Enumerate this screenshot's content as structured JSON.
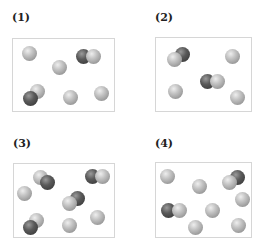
{
  "panels": [
    {
      "label": "(1)",
      "label_pos": [
        12,
        12
      ],
      "box": [
        12,
        38,
        103,
        74
      ],
      "spheres": [
        {
          "x": 29,
          "y": 53,
          "type": "light"
        },
        {
          "x": 59,
          "y": 67,
          "type": "light"
        },
        {
          "x": 83,
          "y": 56,
          "type": "dark"
        },
        {
          "x": 93,
          "y": 56,
          "type": "light"
        },
        {
          "x": 37,
          "y": 91,
          "type": "light"
        },
        {
          "x": 30,
          "y": 98,
          "type": "dark"
        },
        {
          "x": 70,
          "y": 97,
          "type": "light"
        },
        {
          "x": 101,
          "y": 93,
          "type": "light"
        }
      ]
    },
    {
      "label": "(2)",
      "label_pos": [
        155,
        12
      ],
      "box": [
        155,
        37,
        97,
        75
      ],
      "spheres": [
        {
          "x": 182,
          "y": 54,
          "type": "dark"
        },
        {
          "x": 174,
          "y": 59,
          "type": "light"
        },
        {
          "x": 232,
          "y": 56,
          "type": "light"
        },
        {
          "x": 207,
          "y": 81,
          "type": "dark"
        },
        {
          "x": 217,
          "y": 81,
          "type": "light"
        },
        {
          "x": 175,
          "y": 91,
          "type": "light"
        },
        {
          "x": 237,
          "y": 97,
          "type": "light"
        }
      ]
    },
    {
      "label": "(3)",
      "label_pos": [
        13,
        138
      ],
      "box": [
        13,
        163,
        102,
        75
      ],
      "spheres": [
        {
          "x": 40,
          "y": 177,
          "type": "light"
        },
        {
          "x": 47,
          "y": 182,
          "type": "dark"
        },
        {
          "x": 92,
          "y": 176,
          "type": "dark"
        },
        {
          "x": 102,
          "y": 176,
          "type": "light"
        },
        {
          "x": 24,
          "y": 193,
          "type": "light"
        },
        {
          "x": 77,
          "y": 198,
          "type": "dark"
        },
        {
          "x": 69,
          "y": 203,
          "type": "light"
        },
        {
          "x": 36,
          "y": 220,
          "type": "light"
        },
        {
          "x": 30,
          "y": 227,
          "type": "dark"
        },
        {
          "x": 69,
          "y": 225,
          "type": "light"
        },
        {
          "x": 97,
          "y": 217,
          "type": "light"
        }
      ]
    },
    {
      "label": "(4)",
      "label_pos": [
        155,
        138
      ],
      "box": [
        155,
        162,
        97,
        76
      ],
      "spheres": [
        {
          "x": 167,
          "y": 176,
          "type": "light"
        },
        {
          "x": 199,
          "y": 186,
          "type": "light"
        },
        {
          "x": 237,
          "y": 177,
          "type": "dark"
        },
        {
          "x": 229,
          "y": 182,
          "type": "light"
        },
        {
          "x": 242,
          "y": 199,
          "type": "light"
        },
        {
          "x": 168,
          "y": 210,
          "type": "dark"
        },
        {
          "x": 179,
          "y": 210,
          "type": "light"
        },
        {
          "x": 212,
          "y": 210,
          "type": "light"
        },
        {
          "x": 195,
          "y": 227,
          "type": "light"
        },
        {
          "x": 238,
          "y": 225,
          "type": "light"
        }
      ]
    }
  ],
  "legend": {
    "light_sphere": "light-gray atom",
    "dark_sphere": "dark-gray atom"
  }
}
